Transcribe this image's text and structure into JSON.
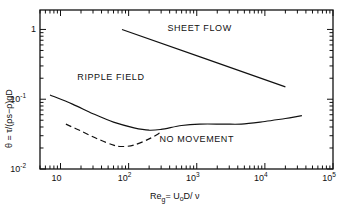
{
  "chart_data": {
    "type": "line",
    "title": "",
    "xlabel": {
      "main": "Re",
      "sub": "g",
      "rest": "= U",
      "sub2": "o",
      "rest2": "D/ ν"
    },
    "ylabel": "θ = τ/(ρs−ρ)gD",
    "xscale": "log",
    "yscale": "log",
    "xlim": [
      5,
      100000
    ],
    "ylim": [
      0.01,
      1.9
    ],
    "grid": false,
    "x_ticks": [
      {
        "value": 10,
        "label": "10",
        "sup": ""
      },
      {
        "value": 100,
        "label": "10",
        "sup": "2"
      },
      {
        "value": 1000,
        "label": "10",
        "sup": "3"
      },
      {
        "value": 10000,
        "label": "10",
        "sup": "4"
      },
      {
        "value": 100000,
        "label": "10",
        "sup": "5"
      }
    ],
    "y_ticks": [
      {
        "value": 1,
        "label": "1",
        "sup": ""
      },
      {
        "value": 0.1,
        "label": "10",
        "sup": "-1"
      },
      {
        "value": 0.01,
        "label": "10",
        "sup": "-2"
      }
    ],
    "series": [
      {
        "name": "sheet-flow-boundary",
        "style": "solid",
        "x": [
          80,
          20000
        ],
        "y": [
          1.0,
          0.15
        ]
      },
      {
        "name": "ripple-threshold",
        "style": "solid",
        "x": [
          7,
          15,
          30,
          60,
          120,
          200,
          300,
          600,
          1100,
          2500,
          4500,
          10000,
          20000,
          35000
        ],
        "y": [
          0.115,
          0.085,
          0.062,
          0.047,
          0.039,
          0.036,
          0.037,
          0.042,
          0.044,
          0.044,
          0.044,
          0.048,
          0.053,
          0.058
        ]
      },
      {
        "name": "movement-threshold",
        "style": "dashed",
        "x": [
          12,
          20,
          35,
          60,
          80,
          120,
          200,
          290
        ],
        "y": [
          0.044,
          0.035,
          0.027,
          0.022,
          0.021,
          0.022,
          0.027,
          0.033
        ]
      }
    ],
    "annotations": [
      {
        "text": "SHEET FLOW",
        "x": 1100,
        "y": 0.95
      },
      {
        "text": "RIPPLE FIELD",
        "x": 55,
        "y": 0.19
      },
      {
        "text": "NO MOVEMENT",
        "x": 1000,
        "y": 0.024
      }
    ]
  }
}
